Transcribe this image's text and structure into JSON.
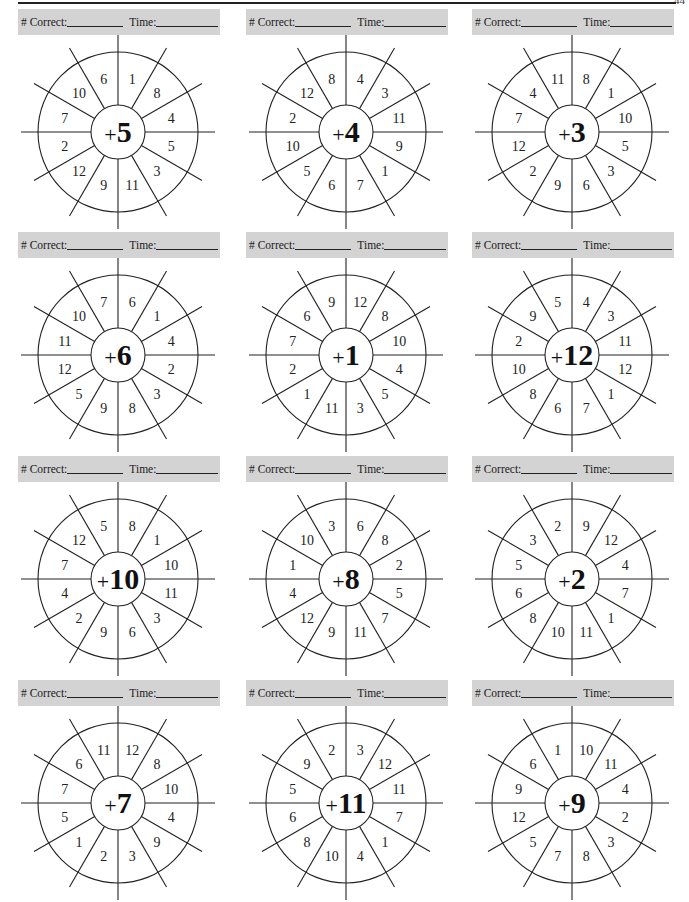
{
  "page": {
    "corner_marker": "44"
  },
  "header": {
    "correct_label": "# Correct:",
    "time_label": "Time:"
  },
  "wheels": [
    {
      "operator": "+",
      "addend": "5",
      "segments": [
        "1",
        "8",
        "4",
        "5",
        "3",
        "11",
        "9",
        "12",
        "2",
        "7",
        "10",
        "6"
      ]
    },
    {
      "operator": "+",
      "addend": "4",
      "segments": [
        "4",
        "3",
        "11",
        "9",
        "1",
        "7",
        "6",
        "5",
        "10",
        "2",
        "12",
        "8"
      ]
    },
    {
      "operator": "+",
      "addend": "3",
      "segments": [
        "8",
        "1",
        "10",
        "5",
        "3",
        "6",
        "9",
        "2",
        "12",
        "7",
        "4",
        "11"
      ]
    },
    {
      "operator": "+",
      "addend": "6",
      "segments": [
        "6",
        "1",
        "4",
        "2",
        "3",
        "8",
        "9",
        "5",
        "12",
        "11",
        "10",
        "7"
      ]
    },
    {
      "operator": "+",
      "addend": "1",
      "segments": [
        "12",
        "8",
        "10",
        "4",
        "5",
        "3",
        "11",
        "1",
        "2",
        "7",
        "6",
        "9"
      ]
    },
    {
      "operator": "+",
      "addend": "12",
      "segments": [
        "4",
        "3",
        "11",
        "12",
        "1",
        "7",
        "6",
        "8",
        "10",
        "2",
        "9",
        "5"
      ]
    },
    {
      "operator": "+",
      "addend": "10",
      "segments": [
        "8",
        "1",
        "10",
        "11",
        "3",
        "6",
        "9",
        "2",
        "4",
        "7",
        "12",
        "5"
      ]
    },
    {
      "operator": "+",
      "addend": "8",
      "segments": [
        "6",
        "8",
        "2",
        "5",
        "7",
        "11",
        "9",
        "12",
        "4",
        "1",
        "10",
        "3"
      ]
    },
    {
      "operator": "+",
      "addend": "2",
      "segments": [
        "9",
        "12",
        "4",
        "7",
        "1",
        "11",
        "10",
        "8",
        "6",
        "5",
        "3",
        "2"
      ]
    },
    {
      "operator": "+",
      "addend": "7",
      "segments": [
        "12",
        "8",
        "10",
        "4",
        "9",
        "3",
        "2",
        "1",
        "5",
        "7",
        "6",
        "11"
      ]
    },
    {
      "operator": "+",
      "addend": "11",
      "segments": [
        "3",
        "12",
        "11",
        "7",
        "1",
        "4",
        "10",
        "8",
        "6",
        "5",
        "9",
        "2"
      ]
    },
    {
      "operator": "+",
      "addend": "9",
      "segments": [
        "10",
        "11",
        "4",
        "2",
        "3",
        "8",
        "7",
        "5",
        "12",
        "9",
        "6",
        "1"
      ]
    }
  ],
  "colors": {
    "header_band": "#d3d3d3",
    "ink": "#1a1a1a"
  }
}
